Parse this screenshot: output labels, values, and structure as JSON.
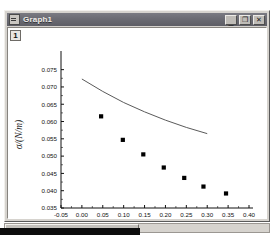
{
  "window": {
    "title": "Graph1",
    "sysmenu_icon": "system-menu-icon",
    "buttons": [
      {
        "name": "minimize",
        "glyph": "_"
      },
      {
        "name": "maximize",
        "glyph": "❐"
      },
      {
        "name": "close",
        "glyph": "✕"
      }
    ]
  },
  "layer": {
    "label": "1"
  },
  "chart_data": {
    "type": "scatter",
    "title": "",
    "xlabel": "c/(mol/L)",
    "ylabel": "σ/(N/m)",
    "xlim": [
      -0.05,
      0.4
    ],
    "ylim": [
      0.035,
      0.0775
    ],
    "grid": false,
    "legend": "none",
    "xticks": [
      "-0.05",
      "0.00",
      "0.05",
      "0.10",
      "0.15",
      "0.20",
      "0.25",
      "0.30",
      "0.35",
      "0.40"
    ],
    "xtick_values": [
      -0.05,
      0.0,
      0.05,
      0.1,
      0.15,
      0.2,
      0.25,
      0.3,
      0.35,
      0.4
    ],
    "yticks": [
      "0.075",
      "0.070",
      "0.065",
      "0.060",
      "0.055",
      "0.050",
      "0.045",
      "0.040",
      "0.035"
    ],
    "ytick_values": [
      0.075,
      0.07,
      0.065,
      0.06,
      0.055,
      0.05,
      0.045,
      0.04,
      0.035
    ],
    "series": [
      {
        "name": "measured",
        "marker": "square",
        "color": "#000000",
        "x": [
          0.046,
          0.098,
          0.147,
          0.196,
          0.245,
          0.291,
          0.345
        ],
        "y": [
          0.0615,
          0.0547,
          0.0505,
          0.0467,
          0.0437,
          0.0412,
          0.0392
        ]
      },
      {
        "name": "fitted-curve",
        "marker": "none",
        "color": "#5a5a5a",
        "x": [
          0.0,
          0.05,
          0.1,
          0.15,
          0.2,
          0.25,
          0.3
        ],
        "y": [
          0.0723,
          0.0687,
          0.0655,
          0.0628,
          0.0604,
          0.0583,
          0.0565
        ]
      }
    ]
  }
}
